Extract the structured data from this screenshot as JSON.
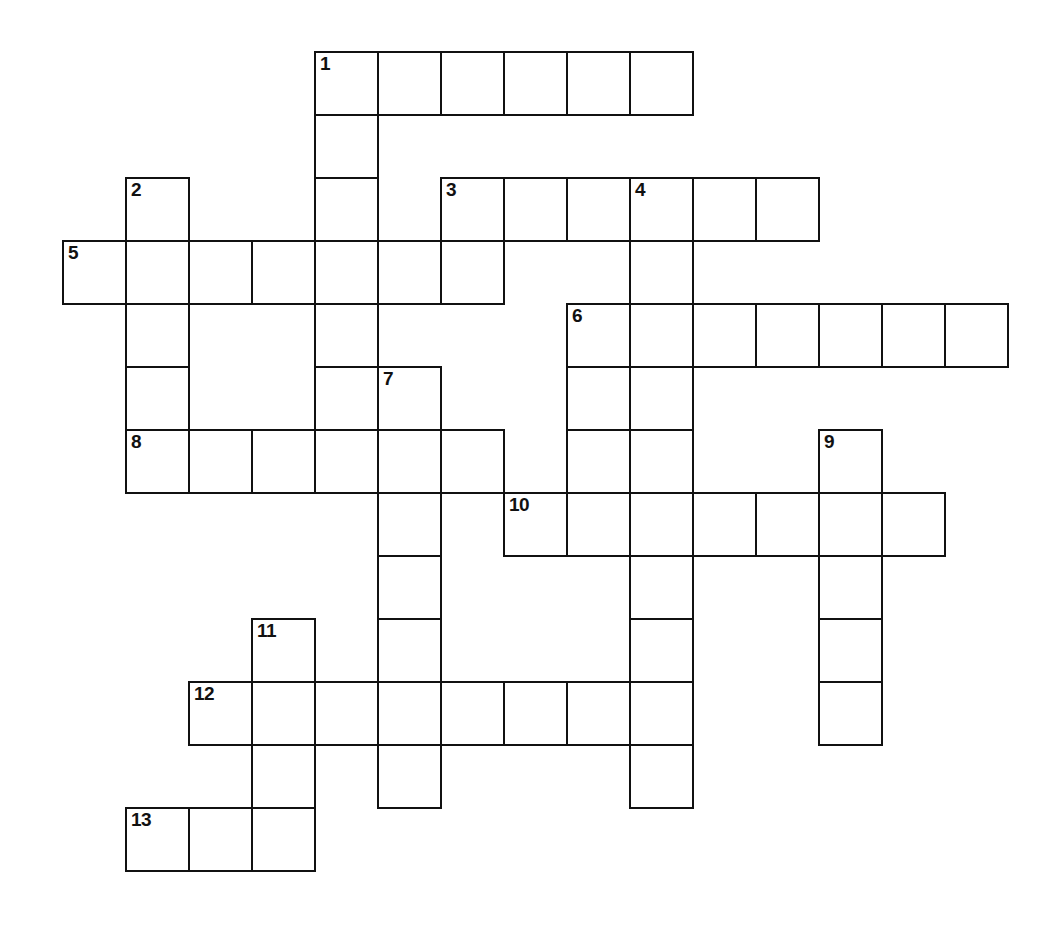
{
  "puzzle": {
    "kind": "crossword-grid",
    "title": "",
    "cell_size": 63,
    "origin": {
      "x": 62,
      "y": 51
    },
    "grid_columns": 16,
    "grid_rows": 14,
    "ink_color": "#111111",
    "cell_fill": "#ffffff",
    "background": "#ffffff",
    "clue_numbers": [
      "1",
      "2",
      "3",
      "4",
      "5",
      "6",
      "7",
      "8",
      "9",
      "10",
      "11",
      "12",
      "13"
    ],
    "entries": [
      {
        "number": "1",
        "direction": "across",
        "col": 4,
        "row": 0,
        "length": 6
      },
      {
        "number": "1",
        "direction": "down",
        "col": 4,
        "row": 0,
        "length": 5
      },
      {
        "number": "2",
        "direction": "down",
        "col": 1,
        "row": 2,
        "length": 5
      },
      {
        "number": "3",
        "direction": "across",
        "col": 6,
        "row": 2,
        "length": 6
      },
      {
        "number": "4",
        "direction": "down",
        "col": 9,
        "row": 2,
        "length": 9
      },
      {
        "number": "5",
        "direction": "across",
        "col": 0,
        "row": 3,
        "length": 6
      },
      {
        "number": "6",
        "direction": "across",
        "col": 8,
        "row": 4,
        "length": 7
      },
      {
        "number": "7",
        "direction": "down",
        "col": 5,
        "row": 5,
        "length": 7
      },
      {
        "number": "8",
        "direction": "across",
        "col": 1,
        "row": 6,
        "length": 6
      },
      {
        "number": "9",
        "direction": "down",
        "col": 12,
        "row": 6,
        "length": 5
      },
      {
        "number": "10",
        "direction": "across",
        "col": 7,
        "row": 7,
        "length": 7
      },
      {
        "number": "11",
        "direction": "down",
        "col": 3,
        "row": 9,
        "length": 4
      },
      {
        "number": "12",
        "direction": "across",
        "col": 2,
        "row": 10,
        "length": 8
      },
      {
        "number": "13",
        "direction": "across",
        "col": 1,
        "row": 12,
        "length": 3
      }
    ],
    "cells": [
      {
        "col": 4,
        "row": 0,
        "num": "1"
      },
      {
        "col": 5,
        "row": 0,
        "num": ""
      },
      {
        "col": 6,
        "row": 0,
        "num": ""
      },
      {
        "col": 7,
        "row": 0,
        "num": ""
      },
      {
        "col": 8,
        "row": 0,
        "num": ""
      },
      {
        "col": 9,
        "row": 0,
        "num": ""
      },
      {
        "col": 4,
        "row": 1,
        "num": ""
      },
      {
        "col": 1,
        "row": 2,
        "num": "2"
      },
      {
        "col": 4,
        "row": 2,
        "num": ""
      },
      {
        "col": 6,
        "row": 2,
        "num": "3"
      },
      {
        "col": 7,
        "row": 2,
        "num": ""
      },
      {
        "col": 8,
        "row": 2,
        "num": ""
      },
      {
        "col": 9,
        "row": 2,
        "num": "4"
      },
      {
        "col": 10,
        "row": 2,
        "num": ""
      },
      {
        "col": 11,
        "row": 2,
        "num": ""
      },
      {
        "col": 0,
        "row": 3,
        "num": "5"
      },
      {
        "col": 1,
        "row": 3,
        "num": ""
      },
      {
        "col": 2,
        "row": 3,
        "num": ""
      },
      {
        "col": 3,
        "row": 3,
        "num": ""
      },
      {
        "col": 4,
        "row": 3,
        "num": ""
      },
      {
        "col": 5,
        "row": 3,
        "num": ""
      },
      {
        "col": 6,
        "row": 3,
        "num": ""
      },
      {
        "col": 9,
        "row": 3,
        "num": ""
      },
      {
        "col": 1,
        "row": 4,
        "num": ""
      },
      {
        "col": 4,
        "row": 4,
        "num": ""
      },
      {
        "col": 8,
        "row": 4,
        "num": "6"
      },
      {
        "col": 9,
        "row": 4,
        "num": ""
      },
      {
        "col": 10,
        "row": 4,
        "num": ""
      },
      {
        "col": 11,
        "row": 4,
        "num": ""
      },
      {
        "col": 12,
        "row": 4,
        "num": ""
      },
      {
        "col": 13,
        "row": 4,
        "num": ""
      },
      {
        "col": 14,
        "row": 4,
        "num": ""
      },
      {
        "col": 1,
        "row": 5,
        "num": ""
      },
      {
        "col": 4,
        "row": 5,
        "num": ""
      },
      {
        "col": 5,
        "row": 5,
        "num": "7"
      },
      {
        "col": 8,
        "row": 5,
        "num": ""
      },
      {
        "col": 9,
        "row": 5,
        "num": ""
      },
      {
        "col": 1,
        "row": 6,
        "num": "8"
      },
      {
        "col": 2,
        "row": 6,
        "num": ""
      },
      {
        "col": 3,
        "row": 6,
        "num": ""
      },
      {
        "col": 4,
        "row": 6,
        "num": ""
      },
      {
        "col": 5,
        "row": 6,
        "num": ""
      },
      {
        "col": 6,
        "row": 6,
        "num": ""
      },
      {
        "col": 8,
        "row": 6,
        "num": ""
      },
      {
        "col": 9,
        "row": 6,
        "num": ""
      },
      {
        "col": 12,
        "row": 6,
        "num": "9"
      },
      {
        "col": 5,
        "row": 7,
        "num": ""
      },
      {
        "col": 7,
        "row": 7,
        "num": "10"
      },
      {
        "col": 8,
        "row": 7,
        "num": ""
      },
      {
        "col": 9,
        "row": 7,
        "num": ""
      },
      {
        "col": 10,
        "row": 7,
        "num": ""
      },
      {
        "col": 11,
        "row": 7,
        "num": ""
      },
      {
        "col": 12,
        "row": 7,
        "num": ""
      },
      {
        "col": 13,
        "row": 7,
        "num": ""
      },
      {
        "col": 5,
        "row": 8,
        "num": ""
      },
      {
        "col": 9,
        "row": 8,
        "num": ""
      },
      {
        "col": 12,
        "row": 8,
        "num": ""
      },
      {
        "col": 3,
        "row": 9,
        "num": "11"
      },
      {
        "col": 5,
        "row": 9,
        "num": ""
      },
      {
        "col": 9,
        "row": 9,
        "num": ""
      },
      {
        "col": 12,
        "row": 9,
        "num": ""
      },
      {
        "col": 2,
        "row": 10,
        "num": "12"
      },
      {
        "col": 3,
        "row": 10,
        "num": ""
      },
      {
        "col": 4,
        "row": 10,
        "num": ""
      },
      {
        "col": 5,
        "row": 10,
        "num": ""
      },
      {
        "col": 6,
        "row": 10,
        "num": ""
      },
      {
        "col": 7,
        "row": 10,
        "num": ""
      },
      {
        "col": 8,
        "row": 10,
        "num": ""
      },
      {
        "col": 9,
        "row": 10,
        "num": ""
      },
      {
        "col": 12,
        "row": 10,
        "num": ""
      },
      {
        "col": 3,
        "row": 11,
        "num": ""
      },
      {
        "col": 5,
        "row": 11,
        "num": ""
      },
      {
        "col": 9,
        "row": 11,
        "num": ""
      },
      {
        "col": 1,
        "row": 12,
        "num": "13"
      },
      {
        "col": 2,
        "row": 12,
        "num": ""
      },
      {
        "col": 3,
        "row": 12,
        "num": ""
      }
    ]
  }
}
